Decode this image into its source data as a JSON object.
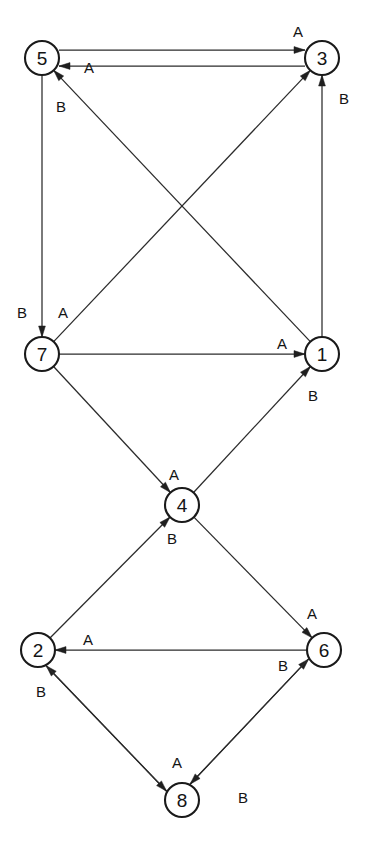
{
  "diagram": {
    "caption": "",
    "background_color": "#ffffff",
    "stroke_color": "#1f1f1f",
    "node_radius": 17,
    "nodes": [
      {
        "id": "5",
        "label": "5",
        "x": 42,
        "y": 58
      },
      {
        "id": "3",
        "label": "3",
        "x": 322,
        "y": 58
      },
      {
        "id": "7",
        "label": "7",
        "x": 42,
        "y": 354
      },
      {
        "id": "1",
        "label": "1",
        "x": 322,
        "y": 354
      },
      {
        "id": "4",
        "label": "4",
        "x": 182,
        "y": 505
      },
      {
        "id": "2",
        "label": "2",
        "x": 38,
        "y": 650
      },
      {
        "id": "6",
        "label": "6",
        "x": 324,
        "y": 650
      },
      {
        "id": "8",
        "label": "8",
        "x": 182,
        "y": 800
      }
    ],
    "edges": [
      {
        "from": "5",
        "to": "3",
        "label": "A",
        "lx": 298,
        "ly": 31,
        "offset": -8
      },
      {
        "from": "3",
        "to": "5",
        "label": "A",
        "lx": 89,
        "ly": 67,
        "offset": -8
      },
      {
        "from": "5",
        "to": "7",
        "label": "B",
        "lx": 22,
        "ly": 312,
        "offset": 0
      },
      {
        "from": "1",
        "to": "3",
        "label": "B",
        "lx": 344,
        "ly": 98,
        "offset": 0
      },
      {
        "from": "1",
        "to": "5",
        "label": "B",
        "lx": 61,
        "ly": 106,
        "offset": 0
      },
      {
        "from": "7",
        "to": "3",
        "label": "A",
        "lx": 63,
        "ly": 312,
        "offset": 0
      },
      {
        "from": "7",
        "to": "1",
        "label": "A",
        "lx": 282,
        "ly": 343,
        "offset": 0
      },
      {
        "from": "7",
        "to": "4",
        "label": "A",
        "lx": 174,
        "ly": 474,
        "offset": 0
      },
      {
        "from": "4",
        "to": "1",
        "label": "B",
        "lx": 313,
        "ly": 395,
        "offset": 0
      },
      {
        "from": "2",
        "to": "4",
        "label": "B",
        "lx": 172,
        "ly": 538,
        "offset": 0
      },
      {
        "from": "4",
        "to": "6",
        "label": "A",
        "lx": 312,
        "ly": 613,
        "offset": 0
      },
      {
        "from": "6",
        "to": "2",
        "label": "A",
        "lx": 88,
        "ly": 639,
        "offset": 0
      },
      {
        "from": "8",
        "to": "2",
        "label": "B",
        "lx": 41,
        "ly": 691,
        "offset": -5
      },
      {
        "from": "2",
        "to": "8",
        "label": "A",
        "lx": 177,
        "ly": 762,
        "offset": 5
      },
      {
        "from": "8",
        "to": "6",
        "label": "B",
        "lx": 283,
        "ly": 665,
        "offset": -5
      },
      {
        "from": "6",
        "to": "8",
        "label": "B",
        "lx": 243,
        "ly": 797,
        "offset": 5
      }
    ],
    "legend": {
      "symbols": [
        "A",
        "B"
      ]
    }
  }
}
